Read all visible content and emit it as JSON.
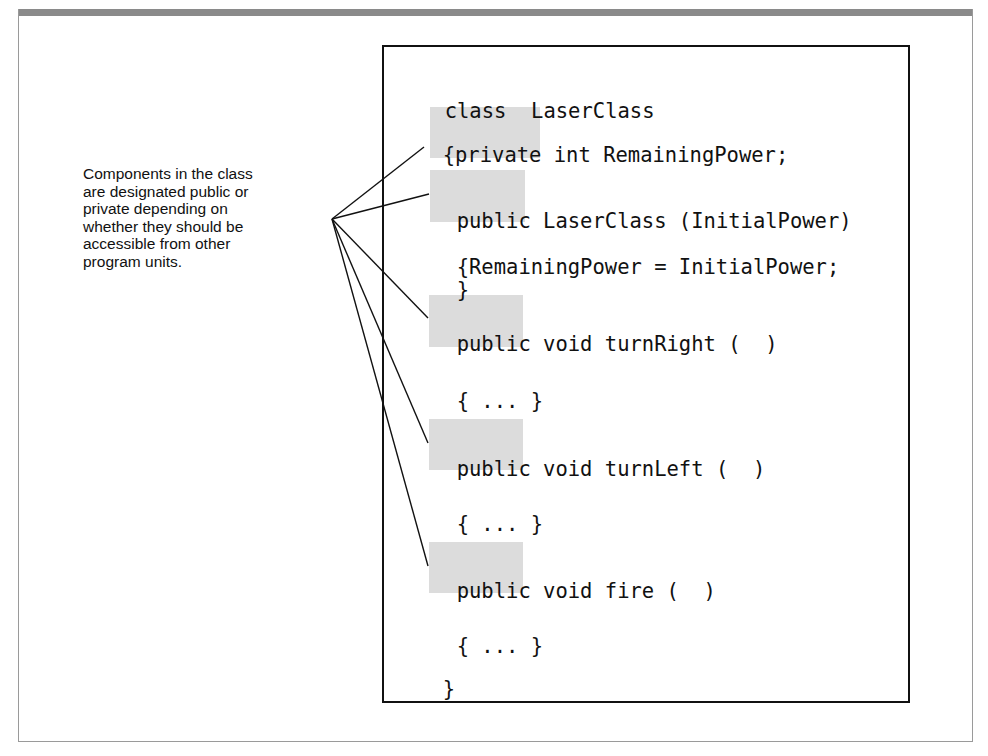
{
  "caption": {
    "lines": [
      "Components in the class",
      "are designated public or",
      "private depending on",
      "whether they should be",
      "accessible from other",
      "program units."
    ]
  },
  "code": {
    "class_header": "class  LaserClass",
    "lines": [
      {
        "prefix": "{",
        "keyword": "private",
        "rest": " int RemainingPower;"
      },
      {
        "prefix": "",
        "keyword": "public",
        "rest": " LaserClass (InitialPower)"
      },
      {
        "text": "{RemainingPower = InitialPower;"
      },
      {
        "text": "}"
      },
      {
        "prefix": "",
        "keyword": "public",
        "rest": " void turnRight (  )"
      },
      {
        "text": "{ ... }"
      },
      {
        "prefix": "",
        "keyword": "public",
        "rest": " void turnLeft (  )"
      },
      {
        "text": "{ ... }"
      },
      {
        "prefix": "",
        "keyword": "public",
        "rest": " void fire (  )"
      },
      {
        "text": "{ ... }"
      },
      {
        "text": "}"
      }
    ]
  },
  "colors": {
    "highlight": "#dcdcdc",
    "frame_bar": "#8a8a8a",
    "ink": "#111111"
  }
}
